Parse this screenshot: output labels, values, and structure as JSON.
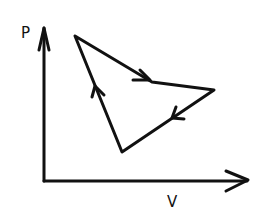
{
  "diagram": {
    "type": "pv-cycle",
    "axes": {
      "y_label": "P",
      "x_label": "V"
    },
    "cycle": {
      "vertices": [
        {
          "name": "A",
          "x": 75,
          "y": 36
        },
        {
          "name": "B",
          "x": 214,
          "y": 90
        },
        {
          "name": "C",
          "x": 122,
          "y": 152
        }
      ],
      "direction": "clockwise",
      "edges": [
        "A→B",
        "B→C",
        "C→A"
      ]
    },
    "colors": {
      "stroke": "#111111",
      "background": "#ffffff"
    }
  }
}
